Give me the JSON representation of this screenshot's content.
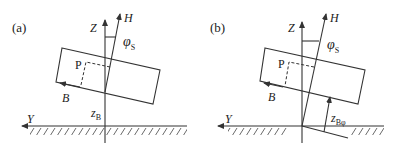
{
  "figure": {
    "panels": [
      {
        "id": "a",
        "label": "(a)",
        "axis_z": "Z",
        "axis_h": "H",
        "axis_y": "Y",
        "angle_symbol": "φ",
        "angle_sub": "S",
        "point": "P",
        "vector_b": "B",
        "height_label": "z",
        "height_sub": "B"
      },
      {
        "id": "b",
        "label": "(b)",
        "axis_z": "Z",
        "axis_h": "H",
        "axis_y": "Y",
        "angle_symbol": "φ",
        "angle_sub": "S",
        "point": "P",
        "vector_b": "B",
        "height_label": "z",
        "height_sub": "Bφ"
      }
    ],
    "colors": {
      "line": "#333333",
      "text": "#222222",
      "background": "#ffffff"
    }
  }
}
